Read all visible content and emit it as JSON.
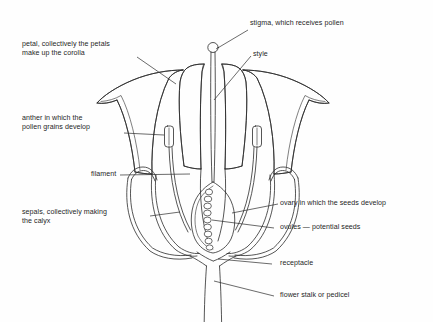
{
  "figure": {
    "line_color": "#2b2b2b",
    "background_color": "#fefefe"
  },
  "labels": {
    "petal": {
      "line1": "petal, collectively the petals",
      "line2": "make up the corolla"
    },
    "stigma": {
      "line1": "stigma, which receives pollen"
    },
    "style": {
      "line1": "style"
    },
    "anther": {
      "line1": "anther in which the",
      "line2": "pollen grains develop"
    },
    "filament": {
      "line1": "filament"
    },
    "sepals": {
      "line1": "sepals, collectively making",
      "line2": "the calyx"
    },
    "ovary": {
      "line1": "ovary in which the seeds develop"
    },
    "ovules": {
      "line1": "ovules — potential seeds"
    },
    "receptacle": {
      "line1": "receptacle"
    },
    "pedicel": {
      "line1": "flower stalk or pedicel"
    }
  },
  "parts": {
    "ovule_count": 9,
    "anther_count": 2,
    "petal_count": 4,
    "sepal_count": 2
  }
}
